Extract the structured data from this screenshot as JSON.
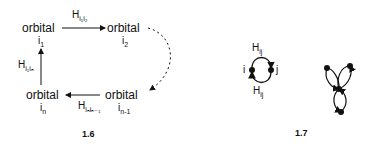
{
  "figure_1_6": {
    "caption": "1.6",
    "nodes": [
      {
        "label": "orbital",
        "index": "i",
        "index_sub": "1"
      },
      {
        "label": "orbital",
        "index": "i",
        "index_sub": "2"
      },
      {
        "label": "orbital",
        "index": "i",
        "index_sub": "n-1"
      },
      {
        "label": "orbital",
        "index": "i",
        "index_sub": "n"
      }
    ],
    "edges": [
      {
        "label": "H",
        "sub": "i₁i₂",
        "from": "i1",
        "to": "i2",
        "style": "solid"
      },
      {
        "from": "i2",
        "to": "in-1",
        "style": "dashed"
      },
      {
        "label": "H",
        "sub": "iₙiₙ₋₁",
        "from": "in-1",
        "to": "in",
        "style": "solid"
      },
      {
        "label": "H",
        "sub": "i₁iₙ",
        "from": "in",
        "to": "i1",
        "style": "solid"
      }
    ]
  },
  "figure_1_7": {
    "caption": "1.7",
    "left": {
      "node_i": "i",
      "node_j": "j",
      "top_label": "H",
      "top_sub": "ij",
      "bottom_label": "H",
      "bottom_sub": "ij"
    },
    "right": {
      "nodes": 4,
      "description": "three loops meeting at a central node"
    }
  }
}
